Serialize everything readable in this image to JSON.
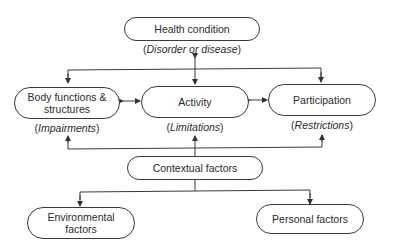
{
  "nodes": {
    "health_condition": {
      "label": "Health condition",
      "sublabel_open": "(",
      "sublabel": "Disorder or disease",
      "sublabel_close": ")"
    },
    "body_functions": {
      "label": "Body functions & structures",
      "sublabel_open": "(",
      "sublabel": "Impairments",
      "sublabel_close": ")"
    },
    "activity": {
      "label": "Activity",
      "sublabel_open": "(",
      "sublabel": "Limitations",
      "sublabel_close": ")"
    },
    "participation": {
      "label": "Participation",
      "sublabel_open": "(",
      "sublabel": "Restrictions",
      "sublabel_close": ")"
    },
    "contextual_factors": {
      "label": "Contextual factors"
    },
    "environmental_factors": {
      "label": "Environmental factors"
    },
    "personal_factors": {
      "label": "Personal factors"
    }
  },
  "edges": [
    {
      "from": "health_condition",
      "to": "activity",
      "type": "bidirectional"
    },
    {
      "from": "health_condition",
      "to": "body_functions",
      "type": "directed"
    },
    {
      "from": "health_condition",
      "to": "participation",
      "type": "directed"
    },
    {
      "from": "body_functions",
      "to": "activity",
      "type": "bidirectional"
    },
    {
      "from": "activity",
      "to": "participation",
      "type": "bidirectional"
    },
    {
      "from": "contextual_factors",
      "to": "body_functions",
      "type": "directed"
    },
    {
      "from": "contextual_factors",
      "to": "activity",
      "type": "directed"
    },
    {
      "from": "contextual_factors",
      "to": "participation",
      "type": "directed"
    },
    {
      "from": "contextual_factors",
      "to": "environmental_factors",
      "type": "directed"
    },
    {
      "from": "contextual_factors",
      "to": "personal_factors",
      "type": "directed"
    }
  ],
  "colors": {
    "stroke": "#3a3a3a",
    "text": "#2b2b2b",
    "background": "#ffffff"
  }
}
